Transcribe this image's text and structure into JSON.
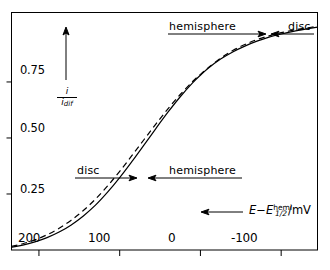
{
  "chart_data": {
    "type": "line",
    "title": "",
    "xlabel": "E - E_1/2^hemi /mV",
    "ylabel": "i / i_dif",
    "xlim": [
      234,
      -145
    ],
    "ylim": [
      0.0,
      1.06
    ],
    "x_reversed": true,
    "grid": false,
    "legend": "none",
    "xticks": [
      200,
      100,
      0,
      -100
    ],
    "xtick_labels": [
      "200",
      "100",
      "0",
      "-100"
    ],
    "yticks": [
      0.25,
      0.5,
      0.75
    ],
    "ytick_labels": [
      "0.25",
      "0.50",
      "0.75"
    ],
    "series": [
      {
        "name": "disc",
        "style": "solid",
        "color": "#000000",
        "points": [
          [
            234,
            0.012
          ],
          [
            220,
            0.022
          ],
          [
            205,
            0.036
          ],
          [
            190,
            0.055
          ],
          [
            175,
            0.08
          ],
          [
            160,
            0.112
          ],
          [
            145,
            0.152
          ],
          [
            130,
            0.2
          ],
          [
            115,
            0.258
          ],
          [
            100,
            0.323
          ],
          [
            85,
            0.394
          ],
          [
            70,
            0.468
          ],
          [
            55,
            0.543
          ],
          [
            40,
            0.616
          ],
          [
            25,
            0.684
          ],
          [
            10,
            0.745
          ],
          [
            0,
            0.78
          ],
          [
            -10,
            0.812
          ],
          [
            -25,
            0.852
          ],
          [
            -40,
            0.884
          ],
          [
            -55,
            0.91
          ],
          [
            -70,
            0.932
          ],
          [
            -85,
            0.95
          ],
          [
            -100,
            0.964
          ],
          [
            -115,
            0.976
          ],
          [
            -130,
            0.986
          ],
          [
            -145,
            0.995
          ]
        ]
      },
      {
        "name": "hemisphere",
        "style": "dashed",
        "color": "#000000",
        "points": [
          [
            234,
            0.016
          ],
          [
            220,
            0.028
          ],
          [
            205,
            0.045
          ],
          [
            190,
            0.068
          ],
          [
            175,
            0.097
          ],
          [
            160,
            0.133
          ],
          [
            145,
            0.176
          ],
          [
            130,
            0.227
          ],
          [
            115,
            0.286
          ],
          [
            100,
            0.351
          ],
          [
            85,
            0.421
          ],
          [
            70,
            0.492
          ],
          [
            55,
            0.563
          ],
          [
            40,
            0.631
          ],
          [
            25,
            0.694
          ],
          [
            10,
            0.751
          ],
          [
            0,
            0.784
          ],
          [
            -10,
            0.815
          ],
          [
            -25,
            0.856
          ],
          [
            -40,
            0.89
          ],
          [
            -55,
            0.917
          ],
          [
            -70,
            0.939
          ],
          [
            -85,
            0.956
          ],
          [
            -100,
            0.97
          ],
          [
            -115,
            0.981
          ],
          [
            -130,
            0.99
          ],
          [
            -145,
            0.998
          ]
        ]
      }
    ],
    "annotations": [
      {
        "name": "top-hemisphere",
        "text": "hemisphere",
        "arrow": "right"
      },
      {
        "name": "top-disc",
        "text": "disc",
        "arrow": "left"
      },
      {
        "name": "mid-disc",
        "text": "disc",
        "arrow": "right"
      },
      {
        "name": "mid-hemisphere",
        "text": "hemisphere",
        "arrow": "left"
      }
    ]
  },
  "axes": {
    "y_numerator": "i",
    "y_denominator_main": "i",
    "y_denominator_sub": "dif",
    "x_label_E": "E",
    "x_label_minus": "−",
    "x_label_E2": "E",
    "x_label_sub": "1/2",
    "x_label_sup": "hemi",
    "x_label_unit": "/mV"
  },
  "ticks": {
    "y": [
      "0.75",
      "0.50",
      "0.25"
    ],
    "x": [
      "200",
      "100",
      "0",
      "-100"
    ]
  },
  "annotations": {
    "top_left_text": "hemisphere",
    "top_right_text": "disc",
    "mid_left_text": "disc",
    "mid_right_text": "hemisphere"
  },
  "colors": {
    "line": "#000000",
    "frame": "#000000",
    "background": "#ffffff"
  }
}
